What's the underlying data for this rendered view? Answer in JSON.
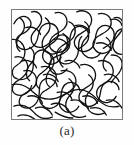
{
  "figure": {
    "caption": "(a)",
    "label": "(a)",
    "frame": {
      "border_color": "#7a7a78",
      "background_color": "#ffffff",
      "x": 11,
      "y": 9,
      "width": 112,
      "height": 111
    },
    "drawing": {
      "type": "tangled-curves",
      "line_color": "#121212",
      "line_width": 1.35,
      "description": "dense randomly coiled and interpenetrating chain curves filling the square frame"
    },
    "page_background": "#ffffff"
  }
}
